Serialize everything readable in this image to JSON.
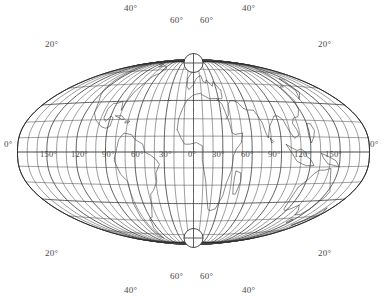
{
  "figure": {
    "name": "world-map-graticule",
    "type": "map",
    "projection": "transverse oblique world projection with polar foci",
    "background_color": "#ffffff",
    "line_color": "#3c3c3c",
    "label_color": "#4a4a4a",
    "width": 387,
    "height": 305
  },
  "degree_symbol": "°",
  "labels": {
    "top": [
      {
        "text": "40°",
        "x": 124,
        "y": 4
      },
      {
        "text": "60°",
        "x": 170,
        "y": 16
      },
      {
        "text": "60°",
        "x": 200,
        "y": 16
      },
      {
        "text": "40°",
        "x": 242,
        "y": 4
      }
    ],
    "bottom": [
      {
        "text": "60°",
        "x": 170,
        "y": 272
      },
      {
        "text": "60°",
        "x": 200,
        "y": 272
      },
      {
        "text": "40°",
        "x": 124,
        "y": 286
      },
      {
        "text": "40°",
        "x": 242,
        "y": 286
      }
    ],
    "corners": [
      {
        "text": "20°",
        "x": 45,
        "y": 40
      },
      {
        "text": "20°",
        "x": 318,
        "y": 40
      },
      {
        "text": "20°",
        "x": 45,
        "y": 249
      },
      {
        "text": "20°",
        "x": 318,
        "y": 249
      }
    ],
    "equator_left_edge": {
      "text": "0°",
      "x": 4,
      "y": 140
    },
    "equator_right_edge": {
      "text": "0°",
      "x": 370,
      "y": 140
    },
    "equator_series": [
      {
        "text": "150°",
        "x": 40,
        "y": 150
      },
      {
        "text": "120°",
        "x": 71,
        "y": 150
      },
      {
        "text": "90°",
        "x": 102,
        "y": 150
      },
      {
        "text": "60°",
        "x": 131,
        "y": 150
      },
      {
        "text": "30°",
        "x": 159,
        "y": 150
      },
      {
        "text": "0°",
        "x": 188,
        "y": 150
      },
      {
        "text": "30°",
        "x": 212,
        "y": 150
      },
      {
        "text": "60°",
        "x": 241,
        "y": 150
      },
      {
        "text": "90°",
        "x": 268,
        "y": 150
      },
      {
        "text": "120°",
        "x": 294,
        "y": 150
      },
      {
        "text": "150°",
        "x": 325,
        "y": 150
      }
    ]
  },
  "geometry": {
    "center_x": 193.5,
    "center_y": 152.0,
    "north_pole": {
      "x": 193.5,
      "y": 63.0,
      "radius": 9.5
    },
    "south_pole": {
      "x": 193.5,
      "y": 238.0,
      "radius": 9.5
    },
    "half_width": 176.0,
    "half_height": 140.0,
    "meridian_step_deg": 10,
    "parallel_step_deg": 10,
    "major_every_deg": 30
  },
  "chart_data": {
    "type": "map",
    "title": "",
    "graticule": {
      "meridians_deg": [
        -180,
        -170,
        -160,
        -150,
        -140,
        -130,
        -120,
        -110,
        -100,
        -90,
        -80,
        -70,
        -60,
        -50,
        -40,
        -30,
        -20,
        -10,
        0,
        10,
        20,
        30,
        40,
        50,
        60,
        70,
        80,
        90,
        100,
        110,
        120,
        130,
        140,
        150,
        160,
        170,
        180
      ],
      "parallels_deg": [
        -80,
        -70,
        -60,
        -50,
        -40,
        -30,
        -20,
        -10,
        0,
        10,
        20,
        30,
        40,
        50,
        60,
        70,
        80
      ],
      "labeled_longitudes": [
        0,
        30,
        60,
        90,
        120,
        150,
        180
      ],
      "labeled_latitudes": [
        0,
        20,
        40,
        60
      ]
    }
  }
}
